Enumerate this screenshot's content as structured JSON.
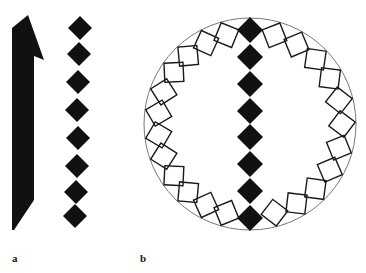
{
  "figure": {
    "panels": [
      {
        "id": "a",
        "label": "a",
        "description": "Filled arrow-like bar beside a vertical chain of filled diamonds",
        "arrow": {
          "color": "#111111",
          "points": [
            [
              12,
              28
            ],
            [
              28,
              15
            ],
            [
              44,
              60
            ],
            [
              34,
              56
            ],
            [
              34,
              200
            ],
            [
              14,
              230
            ],
            [
              12,
              230
            ]
          ]
        },
        "diamond_chain": {
          "color": "#111111",
          "centers": [
            [
              80,
              28
            ],
            [
              79,
              54
            ],
            [
              78,
              82
            ],
            [
              77,
              110
            ],
            [
              78,
              138
            ],
            [
              77,
              166
            ],
            [
              76,
              192
            ],
            [
              75,
              216
            ]
          ],
          "half_size": 12
        }
      },
      {
        "id": "b",
        "label": "b",
        "description": "Circle containing a central vertical chain of filled diamonds flanked by rings of outlined tilted squares along the circumference",
        "circle": {
          "cx": 250,
          "cy": 124,
          "r": 106,
          "stroke": "#777777"
        },
        "center_chain": {
          "color": "#111111",
          "centers": [
            [
              250,
              30
            ],
            [
              250,
              57
            ],
            [
              250,
              84
            ],
            [
              250,
              111
            ],
            [
              250,
              137
            ],
            [
              250,
              164
            ],
            [
              250,
              191
            ],
            [
              250,
              218
            ]
          ],
          "half_size": 13
        },
        "outline_squares": {
          "stroke": "#1a1a1a",
          "side": 19,
          "left_count": 12,
          "right_count": 11,
          "ring_radius": 92
        }
      }
    ]
  }
}
